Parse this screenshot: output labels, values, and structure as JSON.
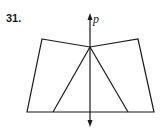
{
  "problem": {
    "number": "31."
  },
  "diagram": {
    "axis_label": "p",
    "stroke_color": "#1a1a1a",
    "quadrilateral": [
      [
        42,
        39
      ],
      [
        90,
        47
      ],
      [
        138,
        39
      ],
      [
        154,
        112
      ],
      [
        27,
        112
      ]
    ],
    "apex": [
      90,
      47
    ],
    "triangle_feet": [
      [
        53,
        112
      ],
      [
        128,
        112
      ]
    ],
    "axis": {
      "x": 90,
      "y_top": 14,
      "y_bottom": 126
    }
  }
}
